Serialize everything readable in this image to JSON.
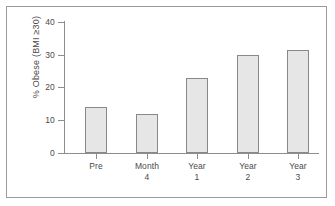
{
  "chart_data": {
    "type": "bar",
    "title": "",
    "subtitle": "",
    "xlabel": "",
    "ylabel": "% Obese (BMI ≥30)",
    "categories": [
      "Pre",
      "Month 4",
      "Year 1",
      "Year 2",
      "Year 3"
    ],
    "category_lines": [
      [
        "Pre"
      ],
      [
        "Month",
        "4"
      ],
      [
        "Year",
        "1"
      ],
      [
        "Year",
        "2"
      ],
      [
        "Year",
        "3"
      ]
    ],
    "values": [
      14,
      12,
      23,
      30,
      31.5
    ],
    "ylim": [
      0,
      40
    ],
    "yticks": [
      0,
      10,
      20,
      30,
      40
    ],
    "ytick_labels": [
      "0",
      "10",
      "20",
      "30",
      "40"
    ],
    "grid": false,
    "legend": null,
    "bar_fill_color": "#e6e6e6",
    "bar_edge_color": "#888888",
    "axis_color": "#8d8d8d",
    "text_color": "#4a4a4a",
    "frame_color": "#9a9a9a",
    "background_color": "#ffffff"
  }
}
